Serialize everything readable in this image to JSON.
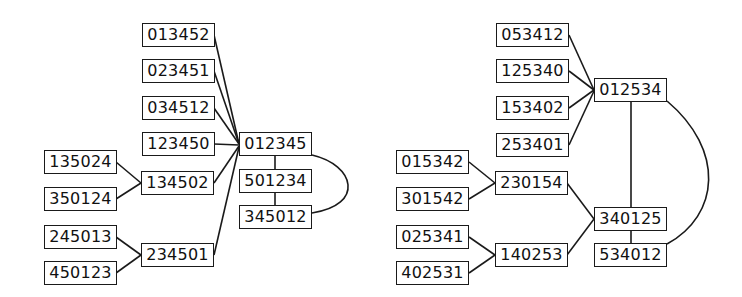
{
  "colors": {
    "stroke": "#1a1a1a",
    "text": "#111111",
    "background": "#ffffff"
  },
  "graphs": [
    {
      "name": "left-graph",
      "nodes": [
        {
          "id": "013452",
          "label": "013452",
          "x": 142,
          "y": 23
        },
        {
          "id": "023451",
          "label": "023451",
          "x": 142,
          "y": 59
        },
        {
          "id": "034512",
          "label": "034512",
          "x": 142,
          "y": 96
        },
        {
          "id": "123450",
          "label": "123450",
          "x": 142,
          "y": 132
        },
        {
          "id": "012345",
          "label": "012345",
          "x": 239,
          "y": 132
        },
        {
          "id": "135024",
          "label": "135024",
          "x": 44,
          "y": 150
        },
        {
          "id": "134502",
          "label": "134502",
          "x": 141,
          "y": 171
        },
        {
          "id": "501234",
          "label": "501234",
          "x": 239,
          "y": 169
        },
        {
          "id": "350124",
          "label": "350124",
          "x": 44,
          "y": 187
        },
        {
          "id": "345012",
          "label": "345012",
          "x": 239,
          "y": 205
        },
        {
          "id": "245013",
          "label": "245013",
          "x": 44,
          "y": 225
        },
        {
          "id": "234501",
          "label": "234501",
          "x": 141,
          "y": 243
        },
        {
          "id": "450123",
          "label": "450123",
          "x": 44,
          "y": 261
        }
      ],
      "edges": [
        {
          "from": "013452",
          "to": "012345",
          "path": "M214,35 L239,144"
        },
        {
          "from": "023451",
          "to": "012345",
          "path": "M214,71 L239,144"
        },
        {
          "from": "034512",
          "to": "012345",
          "path": "M214,108 L239,144"
        },
        {
          "from": "123450",
          "to": "012345",
          "path": "M214,144 L239,145"
        },
        {
          "from": "134502",
          "to": "012345",
          "path": "M214,183 L239,146"
        },
        {
          "from": "234501",
          "to": "012345",
          "path": "M214,255 L239,147"
        },
        {
          "from": "135024",
          "to": "134502",
          "path": "M116,162 L141,183"
        },
        {
          "from": "350124",
          "to": "134502",
          "path": "M116,199 L141,183"
        },
        {
          "from": "245013",
          "to": "234501",
          "path": "M116,237 L141,255"
        },
        {
          "from": "450123",
          "to": "234501",
          "path": "M116,273 L141,255"
        },
        {
          "from": "012345",
          "to": "501234",
          "path": "M275,156 L275,169"
        },
        {
          "from": "501234",
          "to": "345012",
          "path": "M275,193 L275,205"
        },
        {
          "from": "012345",
          "to": "345012",
          "path": "M312,155 C355,165 365,205 312,213"
        }
      ]
    },
    {
      "name": "right-graph",
      "nodes": [
        {
          "id": "053412",
          "label": "053412",
          "x": 496,
          "y": 23
        },
        {
          "id": "125340",
          "label": "125340",
          "x": 496,
          "y": 59
        },
        {
          "id": "012534",
          "label": "012534",
          "x": 594,
          "y": 78
        },
        {
          "id": "153402",
          "label": "153402",
          "x": 496,
          "y": 96
        },
        {
          "id": "253401",
          "label": "253401",
          "x": 496,
          "y": 133
        },
        {
          "id": "015342",
          "label": "015342",
          "x": 396,
          "y": 150
        },
        {
          "id": "230154",
          "label": "230154",
          "x": 495,
          "y": 171
        },
        {
          "id": "301542",
          "label": "301542",
          "x": 396,
          "y": 187
        },
        {
          "id": "340125",
          "label": "340125",
          "x": 594,
          "y": 207
        },
        {
          "id": "025341",
          "label": "025341",
          "x": 396,
          "y": 225
        },
        {
          "id": "140253",
          "label": "140253",
          "x": 495,
          "y": 243
        },
        {
          "id": "534012",
          "label": "534012",
          "x": 594,
          "y": 243
        },
        {
          "id": "402531",
          "label": "402531",
          "x": 396,
          "y": 261
        }
      ],
      "edges": [
        {
          "from": "053412",
          "to": "012534",
          "path": "M569,35 L594,90"
        },
        {
          "from": "125340",
          "to": "012534",
          "path": "M569,71 L594,90"
        },
        {
          "from": "153402",
          "to": "012534",
          "path": "M569,108 L594,90"
        },
        {
          "from": "253401",
          "to": "012534",
          "path": "M569,145 L594,91"
        },
        {
          "from": "015342",
          "to": "230154",
          "path": "M469,162 L495,183"
        },
        {
          "from": "301542",
          "to": "230154",
          "path": "M469,199 L495,183"
        },
        {
          "from": "025341",
          "to": "140253",
          "path": "M469,237 L495,255"
        },
        {
          "from": "402531",
          "to": "140253",
          "path": "M469,273 L495,255"
        },
        {
          "from": "230154",
          "to": "340125",
          "path": "M567,183 L594,219"
        },
        {
          "from": "140253",
          "to": "340125",
          "path": "M567,255 L594,219"
        },
        {
          "from": "012534",
          "to": "340125",
          "path": "M631,102 L631,207"
        },
        {
          "from": "340125",
          "to": "534012",
          "path": "M631,231 L631,243"
        },
        {
          "from": "012534",
          "to": "534012",
          "path": "M667,101 C725,150 720,215 667,244"
        }
      ]
    }
  ]
}
